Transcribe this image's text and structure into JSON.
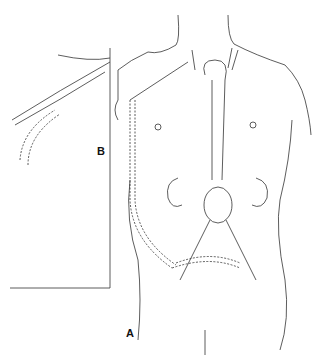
{
  "figure": {
    "panel_a_label": "A",
    "panel_b_label": "B",
    "line_color": "#333333",
    "background": "#ffffff"
  }
}
